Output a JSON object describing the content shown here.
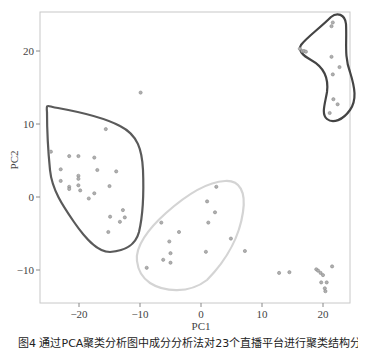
{
  "chart_data": {
    "type": "scatter",
    "title": "",
    "xlabel": "PC1",
    "ylabel": "PC2",
    "xlim": [
      -26.4,
      24.4
    ],
    "ylim": [
      -14.5,
      25.3
    ],
    "grid": false,
    "legend": null,
    "x_ticks": [
      -20,
      -10,
      0,
      10,
      20
    ],
    "y_ticks": [
      -10,
      0,
      10,
      20
    ],
    "x_tick_labels": [
      "−20",
      "−10",
      "0",
      "10",
      "20"
    ],
    "y_tick_labels": [
      "−10",
      "0",
      "10",
      "20"
    ],
    "clusters": [
      {
        "name": "cluster-left",
        "hull_color": "#555555",
        "points": [
          [
            -15.6,
            9.3
          ],
          [
            -24.6,
            6.2
          ],
          [
            -21.6,
            5.6
          ],
          [
            -20.1,
            5.6
          ],
          [
            -17.5,
            5.4
          ],
          [
            -23.0,
            3.8
          ],
          [
            -17.0,
            3.7
          ],
          [
            -13.9,
            3.5
          ],
          [
            -20.1,
            2.9
          ],
          [
            -20.1,
            2.5
          ],
          [
            -23.0,
            2.2
          ],
          [
            -21.6,
            1.4
          ],
          [
            -21.6,
            1.1
          ],
          [
            -20.1,
            1.6
          ],
          [
            -19.8,
            0.9
          ],
          [
            -15.0,
            1.5
          ],
          [
            -17.5,
            0.5
          ],
          [
            -18.4,
            -0.2
          ],
          [
            -12.8,
            -1.8
          ],
          [
            -14.9,
            -2.7
          ],
          [
            -12.5,
            -2.8
          ],
          [
            -13.3,
            -3.4
          ],
          [
            -15.2,
            -4.8
          ]
        ]
      },
      {
        "name": "cluster-middle",
        "hull_color": "#cccccc",
        "points": [
          [
            2.5,
            1.4
          ],
          [
            1.0,
            -0.6
          ],
          [
            2.3,
            -2.1
          ],
          [
            1.2,
            -3.5
          ],
          [
            -6.5,
            -3.5
          ],
          [
            -3.6,
            -4.8
          ],
          [
            4.9,
            -5.7
          ],
          [
            -5.2,
            -6.1
          ],
          [
            0.8,
            -7.5
          ],
          [
            -5.0,
            -7.7
          ],
          [
            -6.2,
            -8.6
          ],
          [
            -5.0,
            -9.0
          ],
          [
            -8.9,
            -9.7
          ]
        ]
      },
      {
        "name": "cluster-top-right",
        "hull_color": "#444444",
        "points": [
          [
            21.6,
            23.9
          ],
          [
            21.4,
            23.4
          ],
          [
            16.2,
            20.3
          ],
          [
            16.6,
            20.0
          ],
          [
            16.9,
            20.0
          ],
          [
            17.2,
            19.9
          ],
          [
            21.4,
            19.2
          ],
          [
            22.7,
            17.8
          ],
          [
            21.6,
            16.8
          ],
          [
            21.7,
            13.4
          ],
          [
            22.4,
            12.7
          ],
          [
            21.1,
            11.5
          ]
        ]
      },
      {
        "name": "unclustered",
        "hull_color": null,
        "points": [
          [
            -9.9,
            14.3
          ],
          [
            7.2,
            -7.4
          ],
          [
            12.8,
            -10.4
          ],
          [
            14.5,
            -10.3
          ],
          [
            18.9,
            -9.9
          ],
          [
            19.2,
            -10.1
          ],
          [
            19.6,
            -10.4
          ],
          [
            21.5,
            -9.5
          ],
          [
            20.0,
            -10.7
          ],
          [
            19.7,
            -11.7
          ],
          [
            20.6,
            -11.7
          ],
          [
            20.3,
            -12.5
          ],
          [
            20.4,
            -12.9
          ]
        ]
      }
    ]
  },
  "caption": "图4  通过PCA聚类分析图中成分分析法对23个直播平台进行聚类结构分析"
}
